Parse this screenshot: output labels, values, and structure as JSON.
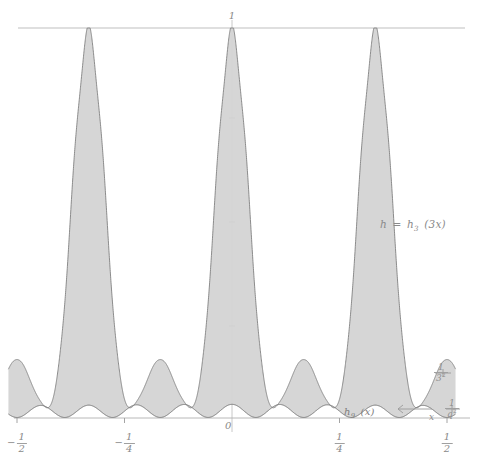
{
  "figure": {
    "background_color": "#ffffff",
    "ink_color": "#8a8a8a",
    "fill_color": "#d2d2d2",
    "envelope_color": "#707070",
    "baseline_curve_color": "#6e6e6e",
    "axis_color": "#b0b0b0"
  },
  "labels": {
    "y_top": "1",
    "origin": "0",
    "x_axis_name": "x",
    "envelope_curve": {
      "lhs": "h",
      "equals": "=",
      "fn": "h",
      "fn_sub": "3",
      "arg": "(3x)",
      "full": "h = h3 (3x)"
    },
    "lower_curve": {
      "fn": "h",
      "fn_sub": "9",
      "arg": "(x)",
      "full": "h9 (x)"
    },
    "right_fraction_upper": {
      "numerator": "1",
      "denominator": "3",
      "denominator_exponent": "2",
      "full": "1/3^2"
    },
    "right_fraction_lower": {
      "numerator": "1",
      "denominator": "q",
      "denominator_exponent": "2",
      "full": "1/q^2"
    }
  },
  "x_ticks": [
    {
      "value": -0.5,
      "numerator": "1",
      "denominator": "2",
      "negative": true
    },
    {
      "value": -0.25,
      "numerator": "1",
      "denominator": "4",
      "negative": true
    },
    {
      "value": 0.25,
      "numerator": "1",
      "denominator": "4",
      "negative": false
    },
    {
      "value": 0.5,
      "numerator": "1",
      "denominator": "2",
      "negative": false
    }
  ],
  "chart_data": {
    "type": "line",
    "title": "",
    "xlabel": "x",
    "ylabel": "h",
    "xlim": [
      -0.52,
      0.52
    ],
    "ylim": [
      0,
      1.04
    ],
    "grid": false,
    "legend_position": "inline-annotations",
    "x_tick_values": [
      -0.5,
      -0.25,
      0,
      0.25,
      0.5
    ],
    "x_tick_labels": [
      "-1/2",
      "-1/4",
      "0",
      "1/4",
      "1/2"
    ],
    "y_tick_values": [
      1
    ],
    "y_tick_labels": [
      "1"
    ],
    "reference_lines": [
      {
        "orientation": "horizontal",
        "value": 1,
        "style": "solid",
        "label": "1"
      },
      {
        "orientation": "vertical",
        "value": 0,
        "style": "solid",
        "label": ""
      }
    ],
    "series": [
      {
        "name": "h = h3 (3x)",
        "role": "upper-envelope",
        "style": "dashed-scalloped",
        "description": "Fejer-type kernel envelope with three major peaks of height 1 at x = 0, -1/3 and 1/3; serrated dashed outline produced by rapid oscillation of the underlying sum.",
        "formula": "h_3(3x)",
        "major_peaks": [
          {
            "x": -0.3333,
            "y": 1.0
          },
          {
            "x": 0.0,
            "y": 1.0
          },
          {
            "x": 0.3333,
            "y": 1.0
          }
        ],
        "minor_peaks": [
          {
            "x": -0.5,
            "y": 0.115
          },
          {
            "x": -0.1667,
            "y": 0.115
          },
          {
            "x": 0.1667,
            "y": 0.115
          },
          {
            "x": 0.5,
            "y": 0.115
          }
        ],
        "zeros": [
          -0.4167,
          -0.25,
          -0.0833,
          0.0833,
          0.25,
          0.4167
        ],
        "oscillation_count_per_peak": 9
      },
      {
        "name": "h9 (x)",
        "role": "lower-curve",
        "style": "solid-smooth",
        "description": "Smooth low-amplitude curve hugging the x-axis with nine gentle humps across the displayed interval; it is the lower boundary of the shaded region.",
        "formula": "h_9(x)",
        "amplitude": 0.035,
        "hump_count": 9,
        "humps": [
          {
            "x": -0.4444,
            "y": 0.036
          },
          {
            "x": -0.3333,
            "y": 0.034
          },
          {
            "x": -0.2222,
            "y": 0.036
          },
          {
            "x": -0.1111,
            "y": 0.034
          },
          {
            "x": 0.0,
            "y": 0.036
          },
          {
            "x": 0.1111,
            "y": 0.034
          },
          {
            "x": 0.2222,
            "y": 0.036
          },
          {
            "x": 0.3333,
            "y": 0.034
          },
          {
            "x": 0.4444,
            "y": 0.036
          }
        ]
      }
    ],
    "shaded_region": {
      "between": [
        "h9 (x)",
        "h = h3 (3x)"
      ],
      "color": "#d2d2d2",
      "description": "Region between the smooth lower curve h9(x) and the dashed envelope h3(3x) is filled light grey."
    },
    "annotations": [
      {
        "text": "h = h3 (3x)",
        "x": 0.395,
        "y": 0.535,
        "anchor": "left"
      },
      {
        "text": "h9 (x)",
        "x": 0.3,
        "y": 0.075,
        "anchor": "center"
      },
      {
        "text": "1/3^2",
        "x": 0.53,
        "y": 0.19,
        "anchor": "left"
      },
      {
        "text": "1/q^2",
        "x": 0.56,
        "y": 0.045,
        "anchor": "left"
      },
      {
        "text": "x",
        "x": 0.52,
        "y": 0.01,
        "anchor": "left"
      }
    ]
  }
}
